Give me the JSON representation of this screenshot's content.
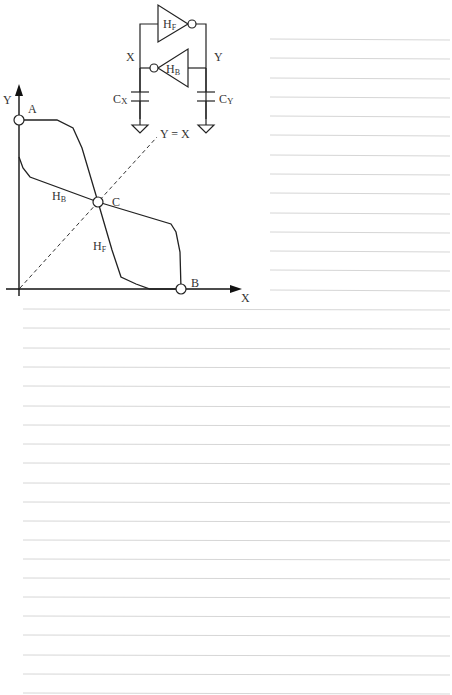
{
  "circuit": {
    "forward_inverter_label": "H",
    "forward_inverter_sub": "F",
    "backward_inverter_label": "H",
    "backward_inverter_sub": "B",
    "node_x_label": "X",
    "node_y_label": "Y",
    "cap_x_label": "C",
    "cap_x_sub": "X",
    "cap_y_label": "C",
    "cap_y_sub": "Y"
  },
  "plot": {
    "x_axis_label": "X",
    "y_axis_label": "Y",
    "diagonal_label": "Y = X",
    "point_a_label": "A",
    "point_b_label": "B",
    "point_c_label": "C",
    "curve_hf_label": "H",
    "curve_hf_sub": "F",
    "curve_hb_label": "H",
    "curve_hb_sub": "B"
  },
  "notes": {
    "ruled_lines_right_count": 14,
    "ruled_lines_full_count": 21
  }
}
